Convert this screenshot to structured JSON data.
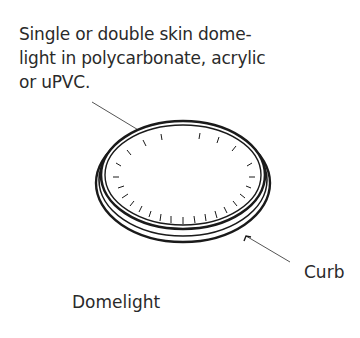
{
  "diagram": {
    "annotation": "Single or double skin dome-\nlight in polycarbonate, acrylic\nor uPVC.",
    "curb_label": "Curb",
    "title": "Domelight",
    "colors": {
      "ink": "#1a1a1a",
      "leader": "#555555",
      "background": "#ffffff"
    }
  }
}
